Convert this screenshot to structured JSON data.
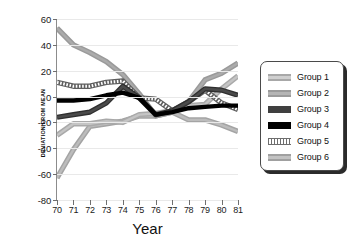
{
  "chart_data": {
    "type": "line",
    "title": "",
    "xlabel": "Year",
    "ylabel": "DEVIATION FROM MEAN",
    "x": [
      70,
      71,
      72,
      73,
      74,
      75,
      76,
      77,
      78,
      79,
      80,
      81
    ],
    "xtick_labels": [
      "70",
      "71",
      "72",
      "73",
      "74",
      "75",
      "76",
      "77",
      "78",
      "79",
      "80",
      "81"
    ],
    "ytick_labels": [
      "60",
      "40",
      "20",
      "0",
      "-20",
      "-40",
      "-60",
      "-80"
    ],
    "yticks": [
      60,
      40,
      20,
      0,
      -20,
      -40,
      -60,
      -80
    ],
    "xlim": [
      70,
      81
    ],
    "ylim": [
      -80,
      60
    ],
    "grid": true,
    "legend_position": "right-outside",
    "series": [
      {
        "name": "Group 1",
        "color": "#c4c4c4",
        "style": "hollow-light-gray",
        "values": [
          -30,
          -21,
          -21,
          -19,
          -20,
          -14,
          -13,
          -11,
          -7,
          -6,
          6,
          16
        ]
      },
      {
        "name": "Group 2",
        "color": "#ababab",
        "style": "medium-gray",
        "values": [
          53,
          40,
          34,
          27,
          17,
          2,
          -15,
          -12,
          -4,
          13,
          18,
          26
        ]
      },
      {
        "name": "Group 3",
        "color": "#3f3f3f",
        "style": "dark-gray-thick",
        "values": [
          -16,
          -14,
          -12,
          -5,
          8,
          -1,
          -14,
          -11,
          -4,
          6,
          5,
          1
        ]
      },
      {
        "name": "Group 4",
        "color": "#000000",
        "style": "solid-black",
        "values": [
          -3,
          -3,
          -2,
          1,
          3,
          -1,
          -14,
          -12,
          -9,
          -8,
          -7,
          -7
        ]
      },
      {
        "name": "Group 5",
        "color": "#6e6e6e",
        "style": "dotted-hatched",
        "values": [
          11,
          8,
          8,
          11,
          12,
          -1,
          -2,
          -11,
          -4,
          5,
          -5,
          -10
        ]
      },
      {
        "name": "Group 6",
        "color": "#bcbcbc",
        "style": "light-gray",
        "values": [
          -63,
          -41,
          -23,
          -21,
          -19,
          -15,
          -15,
          -12,
          -18,
          -18,
          -22,
          -27
        ]
      }
    ]
  },
  "legend": {
    "items": [
      {
        "label": "Group 1",
        "swatch": "sw-g1"
      },
      {
        "label": "Group 2",
        "swatch": "sw-g2"
      },
      {
        "label": "Group 3",
        "swatch": "sw-g3"
      },
      {
        "label": "Group 4",
        "swatch": "sw-g4"
      },
      {
        "label": "Group 5",
        "swatch": "sw-g5"
      },
      {
        "label": "Group 6",
        "swatch": "sw-g6"
      }
    ]
  }
}
